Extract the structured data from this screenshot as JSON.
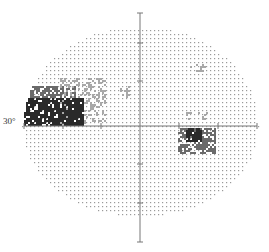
{
  "figure": {
    "type": "visual-field-greyscale-plot",
    "eccentricity_label": "30°",
    "colors": {
      "background": "#ffffff",
      "axis": "#777777",
      "dot": "#9a9a9a",
      "defect_dark": "#2a2a2a",
      "defect_mid": "#6a6a6a",
      "defect_light": "#a8a8a8"
    }
  },
  "geometry": {
    "center": [
      140,
      126
    ],
    "h_axis": {
      "x1": 24,
      "x2": 257,
      "y": 126
    },
    "v_axis": {
      "x": 140,
      "y1": 13,
      "y2": 242
    },
    "tick_spacing": 38,
    "h_ticks": [
      24,
      63,
      101,
      179,
      218,
      257
    ],
    "v_ticks": [
      13,
      43,
      81,
      164,
      203,
      242
    ],
    "field_radius_x": 118,
    "field_radius_y_top": 100,
    "field_radius_y_bottom": 90,
    "dot_step": 4
  },
  "defects": [
    {
      "name": "temporal-dense-defect",
      "x": 24,
      "y": 98,
      "w": 60,
      "h": 27,
      "level": "dark"
    },
    {
      "name": "temporal-defect-upper",
      "x": 30,
      "y": 86,
      "w": 45,
      "h": 12,
      "level": "mid"
    },
    {
      "name": "temporal-defect-fringe",
      "x": 60,
      "y": 78,
      "w": 45,
      "h": 46,
      "level": "light"
    },
    {
      "name": "inferior-nasal-scotoma-core",
      "x": 186,
      "y": 128,
      "w": 16,
      "h": 14,
      "level": "dark"
    },
    {
      "name": "inferior-nasal-scotoma",
      "x": 178,
      "y": 128,
      "w": 38,
      "h": 26,
      "level": "mid"
    },
    {
      "name": "superior-nasal-patch",
      "x": 190,
      "y": 64,
      "w": 16,
      "h": 8,
      "level": "light"
    },
    {
      "name": "nasal-patch-near-axis",
      "x": 186,
      "y": 112,
      "w": 22,
      "h": 8,
      "level": "light"
    },
    {
      "name": "paracentral-patch",
      "x": 120,
      "y": 86,
      "w": 12,
      "h": 12,
      "level": "light"
    }
  ]
}
